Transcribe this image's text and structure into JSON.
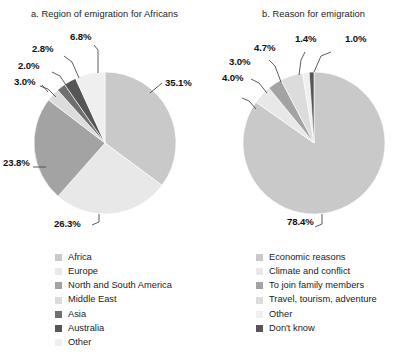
{
  "figure": {
    "background": "#ffffff",
    "text_color": "#1b1b1b"
  },
  "palette": {
    "light_gray": "#c9c9c9",
    "very_light_gray": "#e8e8e8",
    "medium_gray": "#a3a3a3",
    "pale_gray": "#dcdcdc",
    "dark_gray": "#6f6f6f",
    "darker_gray": "#565656",
    "lightest_gray": "#efefef"
  },
  "chart_data": [
    {
      "type": "pie",
      "id": "panel-a",
      "title": "a. Region of emigration for Africans",
      "categories": [
        "Africa",
        "Europe",
        "North and South America",
        "Middle East",
        "Asia",
        "Australia",
        "Other"
      ],
      "values": [
        35.1,
        26.3,
        23.8,
        3.0,
        2.0,
        2.8,
        6.8
      ],
      "labels": [
        "35.1%",
        "26.3%",
        "23.8%",
        "3.0%",
        "2.0%",
        "2.8%",
        "6.8%"
      ],
      "colors": [
        "#c9c9c9",
        "#e8e8e8",
        "#a3a3a3",
        "#dcdcdc",
        "#6f6f6f",
        "#565656",
        "#efefef"
      ],
      "legend_position": "bottom",
      "grid": false,
      "xlabel": "",
      "ylabel": ""
    },
    {
      "type": "pie",
      "id": "panel-b",
      "title": "b. Reason for emigration",
      "categories": [
        "Economic reasons",
        "Climate and conflict",
        "To join family members",
        "Travel, tourism, adventure",
        "Other",
        "Don't know"
      ],
      "values": [
        78.4,
        4.0,
        3.0,
        4.7,
        1.4,
        1.0
      ],
      "labels": [
        "78.4%",
        "4.0%",
        "3.0%",
        "4.7%",
        "1.4%",
        "1.0%"
      ],
      "colors": [
        "#c9c9c9",
        "#e8e8e8",
        "#a3a3a3",
        "#dcdcdc",
        "#efefef",
        "#565656"
      ],
      "legend_position": "bottom",
      "grid": false,
      "xlabel": "",
      "ylabel": ""
    }
  ],
  "panel_a": {
    "title": "a. Region of emigration for Africans",
    "slice_labels": {
      "africa": "35.1%",
      "europe": "26.3%",
      "americas": "23.8%",
      "middle_east": "3.0%",
      "asia": "2.0%",
      "australia": "2.8%",
      "other": "6.8%"
    },
    "legend": [
      {
        "label": "Africa",
        "color": "#c9c9c9"
      },
      {
        "label": "Europe",
        "color": "#e8e8e8"
      },
      {
        "label": "North and South America",
        "color": "#a3a3a3"
      },
      {
        "label": "Middle East",
        "color": "#dcdcdc"
      },
      {
        "label": "Asia",
        "color": "#6f6f6f"
      },
      {
        "label": "Australia",
        "color": "#565656"
      },
      {
        "label": "Other",
        "color": "#efefef"
      }
    ]
  },
  "panel_b": {
    "title": "b. Reason for emigration",
    "slice_labels": {
      "economic": "78.4%",
      "climate": "4.0%",
      "family": "3.0%",
      "travel": "4.7%",
      "other": "1.4%",
      "dont_know": "1.0%"
    },
    "legend": [
      {
        "label": "Economic reasons",
        "color": "#c9c9c9"
      },
      {
        "label": "Climate and conflict",
        "color": "#e8e8e8"
      },
      {
        "label": "To join family members",
        "color": "#a3a3a3"
      },
      {
        "label": "Travel, tourism, adventure",
        "color": "#dcdcdc"
      },
      {
        "label": "Other",
        "color": "#efefef"
      },
      {
        "label": "Don't know",
        "color": "#565656"
      }
    ]
  }
}
